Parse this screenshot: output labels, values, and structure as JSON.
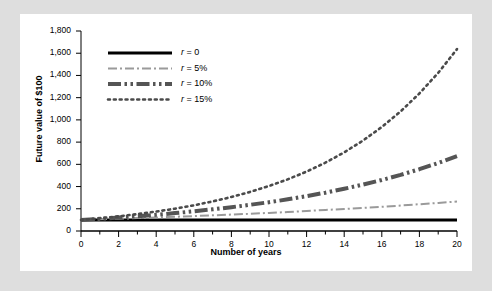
{
  "chart_data": {
    "type": "line",
    "title": "",
    "xlabel": "Number of years",
    "ylabel": "Future value of $100",
    "xlim": [
      0,
      20
    ],
    "ylim": [
      0,
      1800
    ],
    "grid": false,
    "legend_position": "upper-left",
    "x": [
      0,
      1,
      2,
      3,
      4,
      5,
      6,
      7,
      8,
      9,
      10,
      11,
      12,
      13,
      14,
      15,
      16,
      17,
      18,
      19,
      20
    ],
    "xticks": [
      0,
      2,
      4,
      6,
      8,
      10,
      12,
      14,
      16,
      18,
      20
    ],
    "xtick_labels": [
      "0",
      "2",
      "4",
      "6",
      "8",
      "10",
      "12",
      "14",
      "16",
      "18",
      "20"
    ],
    "xminor_ticks": [
      1,
      3,
      5,
      7,
      9,
      11,
      13,
      15,
      17,
      19
    ],
    "yticks": [
      0,
      200,
      400,
      600,
      800,
      1000,
      1200,
      1400,
      1600,
      1800
    ],
    "ytick_labels": [
      "0",
      "200",
      "400",
      "600",
      "800",
      "1,000",
      "1,200",
      "1,400",
      "1,600",
      "1,800"
    ],
    "series": [
      {
        "name": "r = 0",
        "rate": 0,
        "style": "solid",
        "color": "#000000",
        "width": 3,
        "values": [
          100,
          100,
          100,
          100,
          100,
          100,
          100,
          100,
          100,
          100,
          100,
          100,
          100,
          100,
          100,
          100,
          100,
          100,
          100,
          100,
          100
        ]
      },
      {
        "name": "r = 5%",
        "rate": 0.05,
        "style": "dashdot",
        "color": "#9a9a9a",
        "width": 2,
        "values": [
          100,
          105,
          110,
          116,
          122,
          128,
          134,
          141,
          148,
          155,
          163,
          171,
          180,
          189,
          198,
          208,
          218,
          229,
          241,
          253,
          265
        ]
      },
      {
        "name": "r = 10%",
        "rate": 0.1,
        "style": "dashdotdot",
        "color": "#555555",
        "width": 4,
        "values": [
          100,
          110,
          121,
          133,
          146,
          161,
          177,
          195,
          214,
          236,
          259,
          285,
          314,
          345,
          380,
          418,
          459,
          505,
          556,
          612,
          673
        ]
      },
      {
        "name": "r = 15%",
        "rate": 0.15,
        "style": "dotted",
        "color": "#4a4a4a",
        "width": 2.6,
        "values": [
          100,
          115,
          132,
          152,
          175,
          201,
          231,
          266,
          306,
          352,
          405,
          465,
          535,
          615,
          708,
          814,
          936,
          1076,
          1238,
          1423,
          1637
        ]
      }
    ]
  },
  "legend": {
    "entries": [
      {
        "label": "r = 0"
      },
      {
        "label": "r = 5%"
      },
      {
        "label": "r = 10%"
      },
      {
        "label": "r = 15%"
      }
    ]
  },
  "colors": {
    "page_background": "#dedede",
    "panel_background": "#ffffff",
    "axis": "#000000"
  }
}
